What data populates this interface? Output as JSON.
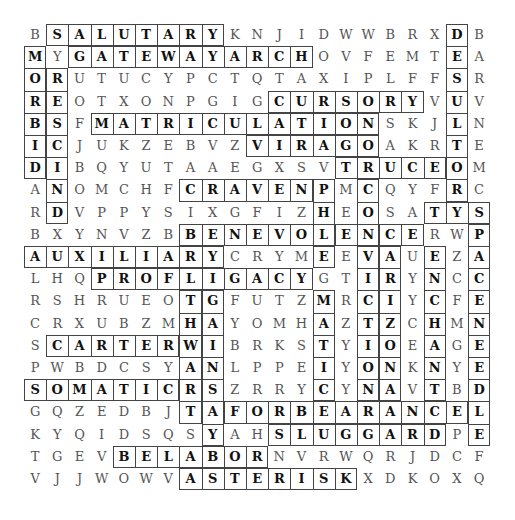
{
  "puzzle": {
    "title": "Word Search",
    "rows": [
      "BSALUTARYKNJIDWWBRXDB",
      "MYGATEWAYARCHOVFEMTEA",
      "ORUTUCYPCTQTAXIPLFFSR",
      "REOTXONPGIGCURSORYVUV",
      "BSFMATRICULATIONSKJLN",
      "ICJUKZEBVZVIRAGOAKRTE",
      "DIBQYUTAAEGXSVTRUCEOM",
      "ANOMCHFCRAVENPMCQYFRC",
      "RDVPPYSIXGFIZHEOSATYS",
      "BXYNVZBBENEVOLENCERWP",
      "AUXILIARYCRYMEEVAUEZA",
      "LHQPROFLIGACYGTIRYNCC",
      "RSHRUEOTGFUTZMRCIYCFE",
      "CRXUBZMHAYOMHAZTZCHMN",
      "SCARTERWIBRKSTYIOEAGE",
      "PWBDCSYANLPPEIYONKNYE",
      "SOMATICRSZRRYCYNAVTBD",
      "GQZEDBJTAFORBEARANCEL",
      "KYQIDSQSYAHSLUGGARDPE",
      "TGEVBELABORNVRWQRJDCF",
      "VJJWOWVASTERISKXDKOXQ"
    ],
    "found_words": [
      {
        "word": "SALUTARY",
        "row": 0,
        "col": 1,
        "dir": "h",
        "len": 8
      },
      {
        "word": "GATEWAYARCH",
        "row": 1,
        "col": 2,
        "dir": "h",
        "len": 11
      },
      {
        "word": "MORBID",
        "row": 1,
        "col": 0,
        "dir": "v",
        "len": 6
      },
      {
        "word": "RESCIND",
        "row": 2,
        "col": 1,
        "dir": "v",
        "len": 7
      },
      {
        "word": "CURSORY",
        "row": 3,
        "col": 11,
        "dir": "h",
        "len": 7
      },
      {
        "word": "MATRICULATION",
        "row": 4,
        "col": 3,
        "dir": "h",
        "len": 13
      },
      {
        "word": "DESULTOR",
        "row": 0,
        "col": 19,
        "dir": "v",
        "len": 8
      },
      {
        "word": "VIRAGO",
        "row": 5,
        "col": 10,
        "dir": "h",
        "len": 6
      },
      {
        "word": "TRUCE",
        "row": 6,
        "col": 14,
        "dir": "h",
        "len": 5
      },
      {
        "word": "CRAVEN",
        "row": 7,
        "col": 7,
        "dir": "h",
        "len": 6
      },
      {
        "word": "BENEVOLENCE",
        "row": 9,
        "col": 7,
        "dir": "h",
        "len": 11
      },
      {
        "word": "AUXILIARY",
        "row": 10,
        "col": 0,
        "dir": "h",
        "len": 9
      },
      {
        "word": "PROFLIGACY",
        "row": 11,
        "col": 3,
        "dir": "h",
        "len": 10
      },
      {
        "word": "CARTER",
        "row": 14,
        "col": 1,
        "dir": "h",
        "len": 6
      },
      {
        "word": "SOMATIC",
        "row": 16,
        "col": 0,
        "dir": "h",
        "len": 7
      },
      {
        "word": "FORBEARANCE",
        "row": 17,
        "col": 9,
        "dir": "h",
        "len": 11
      },
      {
        "word": "SLUGGARD",
        "row": 18,
        "col": 11,
        "dir": "h",
        "len": 8
      },
      {
        "word": "BELABOR",
        "row": 19,
        "col": 4,
        "dir": "h",
        "len": 7
      },
      {
        "word": "ASTERISK",
        "row": 20,
        "col": 7,
        "dir": "h",
        "len": 8
      },
      {
        "word": "SPACENEEDLE",
        "row": 8,
        "col": 20,
        "dir": "v",
        "len": 11
      },
      {
        "word": "ENCHANT",
        "row": 10,
        "col": 18,
        "dir": "v",
        "len": 7
      },
      {
        "word": "THWART",
        "row": 12,
        "col": 7,
        "dir": "v",
        "len": 6
      },
      {
        "word": "GAINSAY",
        "row": 12,
        "col": 8,
        "dir": "v",
        "len": 7
      },
      {
        "word": "MATIC",
        "row": 12,
        "col": 13,
        "dir": "v",
        "len": 5
      },
      {
        "word": "VICTION",
        "row": 10,
        "col": 15,
        "dir": "v",
        "len": 7
      },
      {
        "word": "ARIZONA",
        "row": 10,
        "col": 16,
        "dir": "v",
        "len": 7
      },
      {
        "word": "PHEGMEMATIC",
        "row": 7,
        "col": 13,
        "dir": "v",
        "len": 4
      },
      {
        "word": "CONVICTION",
        "row": 7,
        "col": 15,
        "dir": "v",
        "len": 3
      },
      {
        "word": "TYS",
        "row": 8,
        "col": 18,
        "dir": "h",
        "len": 3
      }
    ]
  }
}
